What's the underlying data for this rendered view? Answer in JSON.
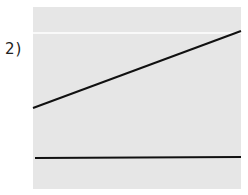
{
  "figure": {
    "label": "2)",
    "panel": {
      "background": "#e6e6e6",
      "x": 33,
      "y": 7,
      "width": 208,
      "height": 182
    },
    "reference_line": {
      "y": 33,
      "color": "#ffffff"
    },
    "lines": [
      {
        "name": "sloped-line",
        "x1": 33,
        "y1": 108,
        "x2": 241,
        "y2": 31,
        "color": "#111111"
      },
      {
        "name": "horizontal-line",
        "x1": 35,
        "y1": 158,
        "x2": 241,
        "y2": 157,
        "color": "#111111"
      }
    ]
  }
}
